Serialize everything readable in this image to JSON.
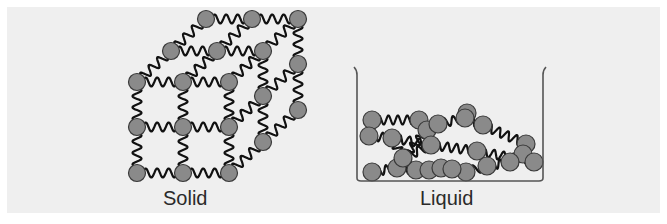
{
  "figure": {
    "type": "states-of-matter-diagram",
    "panels": [
      {
        "id": "solid",
        "label": "Solid",
        "description": "Particles arranged in an ordered 3x3x3 cubic lattice connected by spring-like bonds"
      },
      {
        "id": "liquid",
        "label": "Liquid",
        "description": "Particles disordered at the bottom of a container, still connected by tangled spring-like bonds"
      }
    ]
  },
  "colors": {
    "background": "#efefef",
    "page": "#ffffff",
    "particle_fill": "#8a8a8a",
    "particle_stroke": "#3a3a3a",
    "bond": "#111111",
    "container": "#555555",
    "label_text": "#2a2a2a"
  },
  "solid": {
    "particle_radius": 8.5,
    "front": {
      "xs": [
        137,
        183,
        229
      ],
      "ys": [
        82,
        127,
        173
      ]
    },
    "depth_offsets": [
      [
        0,
        0
      ],
      [
        34,
        -31
      ],
      [
        69,
        -63
      ]
    ]
  },
  "liquid": {
    "container": {
      "left": 357,
      "right": 543,
      "top": 67,
      "bottom": 181
    },
    "particle_radius": 9,
    "particles": [
      [
        372,
        120
      ],
      [
        369,
        136
      ],
      [
        392,
        138
      ],
      [
        419,
        120
      ],
      [
        427,
        130
      ],
      [
        438,
        124
      ],
      [
        467,
        113
      ],
      [
        465,
        118
      ],
      [
        483,
        125
      ],
      [
        526,
        144
      ],
      [
        523,
        154
      ],
      [
        534,
        162
      ],
      [
        431,
        145
      ],
      [
        477,
        151
      ],
      [
        372,
        172
      ],
      [
        397,
        168
      ],
      [
        416,
        170
      ],
      [
        429,
        170
      ],
      [
        441,
        168
      ],
      [
        466,
        172
      ],
      [
        487,
        166
      ],
      [
        510,
        162
      ],
      [
        403,
        158
      ],
      [
        452,
        169
      ]
    ]
  }
}
